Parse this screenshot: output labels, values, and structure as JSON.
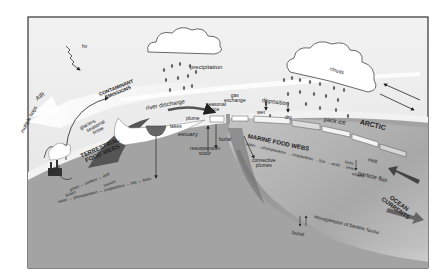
{
  "diagram": {
    "colors": {
      "sky": "#e9e9e9",
      "frame": "#3a3a3a",
      "earth_surface": "#f4f4f4",
      "land": "#9f9f9f",
      "ocean": "#b8b8b8",
      "ocean_deep": "#8a8a8a",
      "cloud": "#ffffff",
      "text": "#222222"
    },
    "atmosphere": {
      "sun": "hν",
      "air": "AIR",
      "multiple_hops": "multiple hops",
      "contaminant_emissions": [
        "CONTAMINANT",
        "EMISSIONS"
      ],
      "precipitation": "precipitation",
      "clouds": "clouds",
      "gas_exchange": [
        "gas",
        "exchange"
      ],
      "deposition": "deposition",
      "wet": "wet",
      "dry": "dry",
      "arctic": "ARCTIC"
    },
    "land": {
      "glaciers": "glaciers",
      "seasonal_snow": [
        "seasonal",
        "snow"
      ],
      "outfall": "outfall",
      "terrestrial_food_webs": [
        "TERRESTRIAL",
        "FOOD WEBS"
      ],
      "chain_1": "grass → caribou → wolf",
      "chain_1_alt": "lichen",
      "insects": "insects",
      "chain_2": "water → phytoplankton → zooplankton → fish → birds",
      "lakes": "lakes"
    },
    "coast": {
      "river_discharge": "river discharge",
      "plume": "plume",
      "estuary": "estuary",
      "seasonal_ice": [
        "seasonal",
        "ice"
      ],
      "burial": "burial",
      "resuspension_scour": [
        "resuspension",
        "scour"
      ]
    },
    "ocean": {
      "marine_food_webs": "MARINE FOOD WEBS",
      "marine_chain": "water → phytoplankton → zooplankton → fish → seals → bears",
      "birds": "birds",
      "whales": "whales",
      "convective_plumes": [
        "convective",
        "plumes"
      ],
      "pack_ice": "pack ice",
      "melt": "melt",
      "particle_flux": "particle flux",
      "ocean_currents": [
        "OCEAN",
        "CURRENTS"
      ],
      "burial": "burial",
      "resuspension_benthic": "resuspension of benthic fauna"
    }
  }
}
